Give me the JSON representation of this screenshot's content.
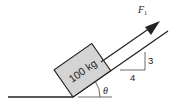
{
  "diagram": {
    "type": "inclined-plane-free-body",
    "block": {
      "label": "100 kg",
      "fill": "#d4d4d4",
      "stroke": "#222222"
    },
    "force": {
      "label": "F",
      "subscript": "1"
    },
    "slope_triangle": {
      "rise_label": "3",
      "run_label": "4"
    },
    "angle": {
      "label": "θ"
    },
    "colors": {
      "line": "#222222",
      "block_fill": "#d4d4d4",
      "background": "#ffffff"
    }
  }
}
